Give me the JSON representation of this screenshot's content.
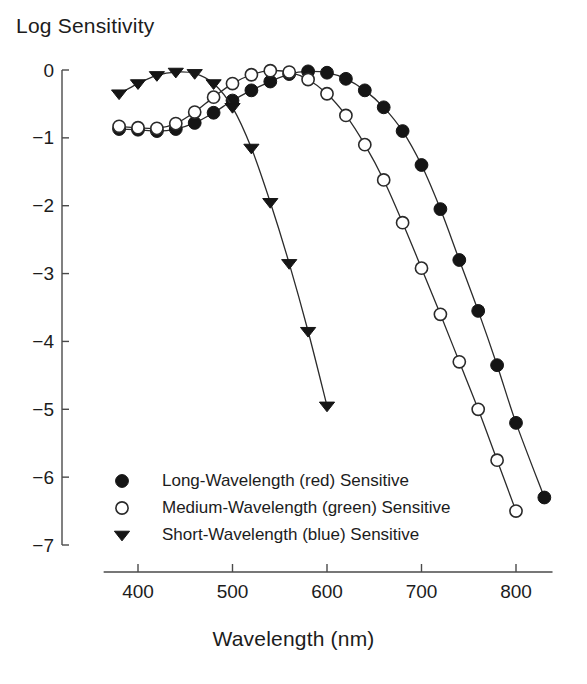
{
  "chart_data": {
    "type": "line",
    "title": "",
    "xlabel": "Wavelength (nm)",
    "ylabel": "Log Sensitivity",
    "xlim": [
      370,
      845
    ],
    "ylim": [
      -7,
      0.3
    ],
    "xticks": [
      400,
      500,
      600,
      700,
      800
    ],
    "yticks": [
      0,
      -1,
      -2,
      -3,
      -4,
      -5,
      -6,
      -7
    ],
    "xtick_labels": [
      "400",
      "500",
      "600",
      "700",
      "800"
    ],
    "ytick_labels": [
      "0",
      "−1",
      "−2",
      "−3",
      "−4",
      "−5",
      "−6",
      "−7"
    ],
    "grid": false,
    "legend_position": "lower-left-inside",
    "series": [
      {
        "name": "Long-Wavelength (red) Sensitive",
        "marker": "filled-circle",
        "color": "#151515",
        "x": [
          380,
          400,
          420,
          440,
          460,
          480,
          500,
          520,
          540,
          560,
          580,
          600,
          620,
          640,
          660,
          680,
          700,
          720,
          740,
          760,
          780,
          800,
          830
        ],
        "y": [
          -0.87,
          -0.88,
          -0.9,
          -0.87,
          -0.78,
          -0.63,
          -0.45,
          -0.3,
          -0.17,
          -0.06,
          -0.02,
          -0.04,
          -0.13,
          -0.3,
          -0.55,
          -0.9,
          -1.4,
          -2.05,
          -2.8,
          -3.55,
          -4.35,
          -5.2,
          -6.3
        ]
      },
      {
        "name": "Medium-Wavelength (green) Sensitive",
        "marker": "open-circle",
        "color": "#ffffff",
        "x": [
          380,
          400,
          420,
          440,
          460,
          480,
          500,
          520,
          540,
          560,
          580,
          600,
          620,
          640,
          660,
          680,
          700,
          720,
          740,
          760,
          780,
          800
        ],
        "y": [
          -0.83,
          -0.85,
          -0.86,
          -0.79,
          -0.62,
          -0.4,
          -0.2,
          -0.07,
          -0.01,
          -0.03,
          -0.14,
          -0.35,
          -0.67,
          -1.1,
          -1.62,
          -2.25,
          -2.92,
          -3.6,
          -4.3,
          -5.0,
          -5.75,
          -6.5
        ]
      },
      {
        "name": "Short-Wavelength (blue) Sensitive",
        "marker": "filled-triangle-down",
        "color": "#151515",
        "x": [
          380,
          400,
          420,
          440,
          460,
          480,
          500,
          520,
          540,
          560,
          580,
          600
        ],
        "y": [
          -0.35,
          -0.2,
          -0.08,
          -0.03,
          -0.05,
          -0.2,
          -0.55,
          -1.15,
          -1.95,
          -2.85,
          -3.85,
          -4.95
        ]
      }
    ]
  },
  "legend": {
    "items": [
      {
        "label": "Long-Wavelength (red) Sensitive",
        "marker": "filled-circle"
      },
      {
        "label": "Medium-Wavelength (green) Sensitive",
        "marker": "open-circle"
      },
      {
        "label": "Short-Wavelength (blue) Sensitive",
        "marker": "filled-triangle-down"
      }
    ]
  }
}
